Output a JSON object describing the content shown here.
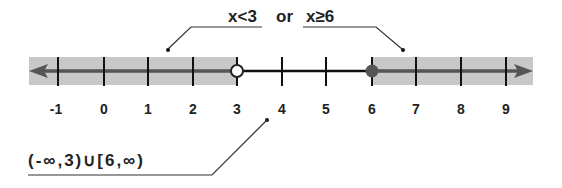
{
  "title": {
    "part1": "x<3",
    "connector": "or",
    "part2": "x≥6"
  },
  "number_line": {
    "ticks": [
      "-1",
      "0",
      "1",
      "2",
      "3",
      "4",
      "5",
      "6",
      "7",
      "8",
      "9"
    ],
    "open_point": "3",
    "closed_point": "6",
    "shaded_left": "(-∞, 3)",
    "shaded_right": "[6, ∞)"
  },
  "interval_notation": "(-∞,3)∪[6,∞)",
  "colors": {
    "shade": "#c8c8c8",
    "ray": "#555555",
    "segment": "#111111",
    "closed_dot": "#555555"
  }
}
